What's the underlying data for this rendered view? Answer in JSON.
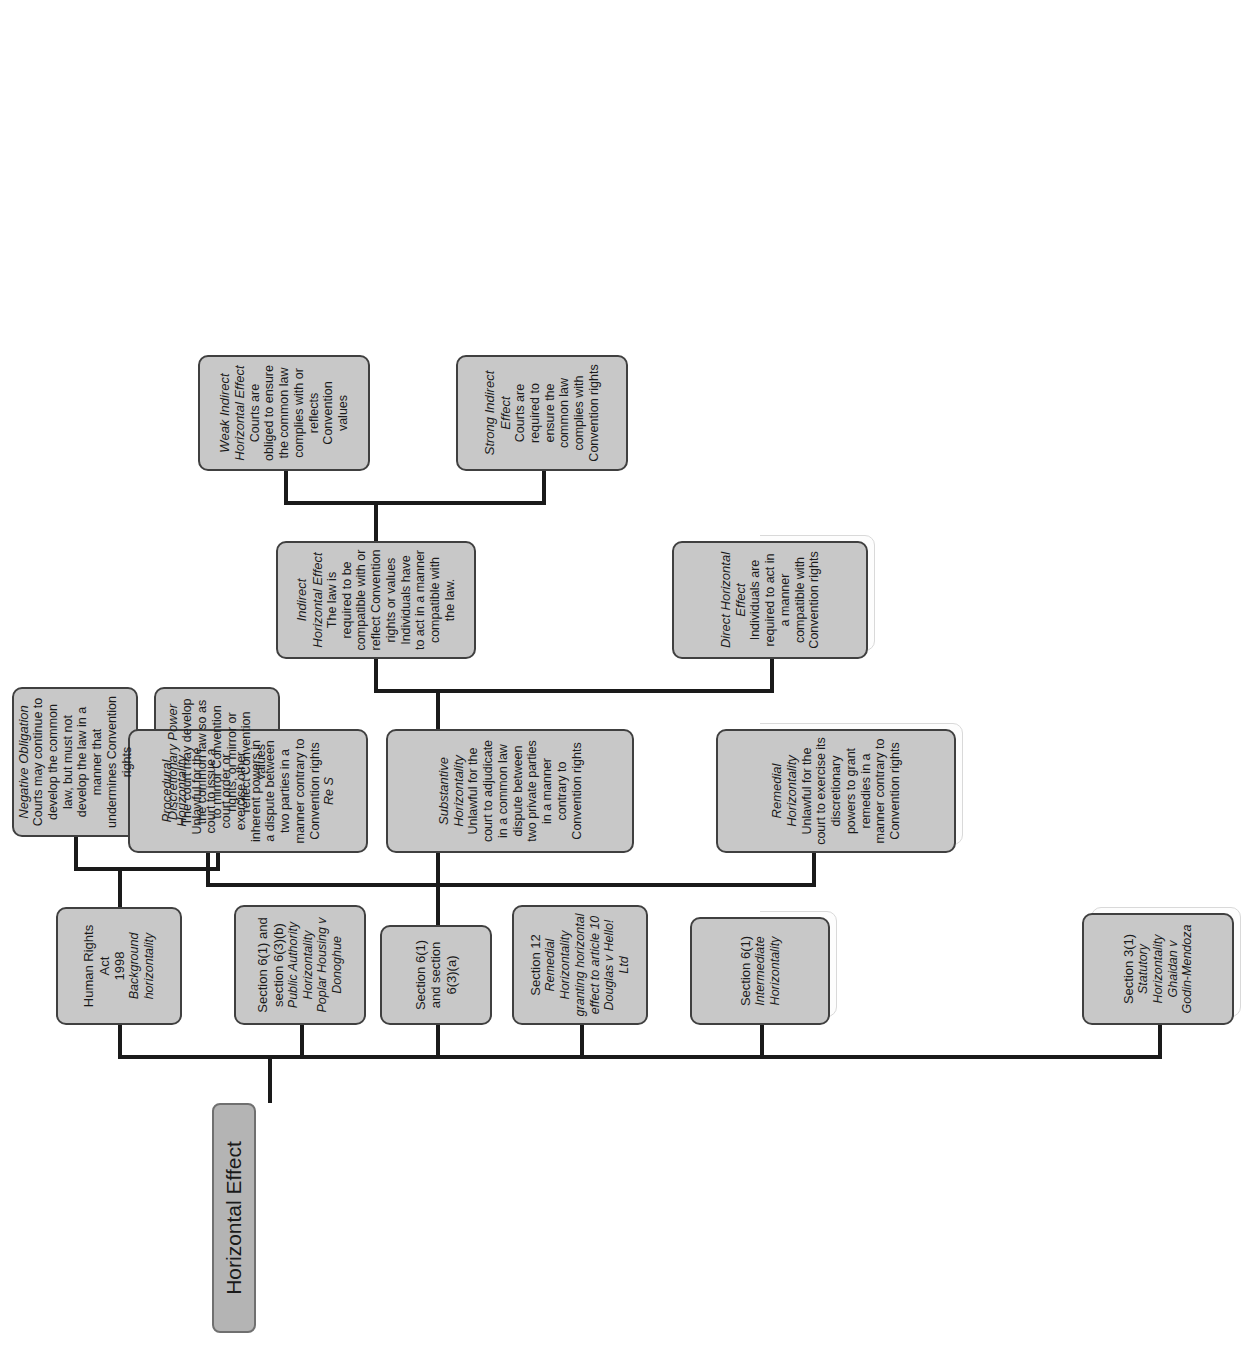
{
  "diagram": {
    "title": "Horizontal Effect",
    "root": {
      "label": "Horizontal Effect"
    },
    "colors": {
      "node_fill": "#c8c8c8",
      "root_fill": "#b4b4b4",
      "node_border": "#404040",
      "line": "#1a1a1a",
      "page_background": "#ffffff",
      "text": "#1a1a1a"
    },
    "branches": {
      "hra": {
        "title": "Human Rights Act",
        "year": "1998",
        "subtitle": "Background horizontality",
        "children": [
          {
            "title": "Negative Obligation",
            "body": "Courts may continue to develop the common law, but must not develop the law in a manner that undermines Convention rights"
          },
          {
            "title": "Discretionary Power",
            "body": "The court may develop the common law so as to mirror Convention rights, or mirror or reflect Convention values"
          }
        ]
      },
      "s6_1_6_3_b": {
        "title": "Section 6(1) and section 6(3)(b)",
        "subtitle": "Public Authority Horizontality",
        "case": "Poplar Housing v Donoghue"
      },
      "s6_1_6_3_a": {
        "title": "Section 6(1) and section 6(3)(a)"
      },
      "s12": {
        "title": "Section 12",
        "subtitle": "Remedial Horizontality granting horizontal effect to article 10",
        "case": "Douglas v Hello! Ltd"
      },
      "s6_1": {
        "title": "Section 6(1)",
        "subtitle": "Intermediate Horizontality"
      },
      "s3_1": {
        "title": "Section 3(1)",
        "subtitle": "Statutory Horizontality",
        "case": "Ghaidan v Godin-Mendoza"
      }
    },
    "horizontality_types": [
      {
        "title": "Procedural Horizontality",
        "body": "Unlawful for the court to issue a court order or exercise other inherent powers in a dispute between two parties in a manner contrary to Convention rights",
        "case": "Re S"
      },
      {
        "title": "Substantive Horizontality",
        "body": "Unlawful for the court to adjudicate in a common law dispute between two private parties in a manner contrary to Convention rights"
      },
      {
        "title": "Remedial Horizontality",
        "body": "Unlawful for the court to exercise its discretionary powers to grant remedies in a manner contrary to Convention rights"
      }
    ],
    "effects": [
      {
        "title": "Indirect Horizontal Effect",
        "body": "The law is required to be compatible with or reflect Convention rights or values Individuals have to act in a manner compatible with the law."
      },
      {
        "title": "Direct Horizontal Effect",
        "body": "Individuals are required to act in a manner compatible with Convention rights"
      }
    ],
    "indirect_children": [
      {
        "title": "Weak Indirect Horizontal Effect",
        "body": "Courts are obliged to ensure the common law complies with or reflects Convention values"
      },
      {
        "title": "Strong Indirect Effect",
        "body": "Courts are required to ensure the common law complies with Convention rights"
      }
    ]
  }
}
